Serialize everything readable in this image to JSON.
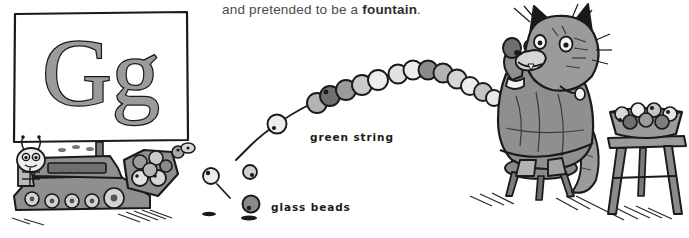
{
  "page": {
    "background_color": "#ffffff",
    "width": 689,
    "height": 238,
    "type": "illustrated-alphabet-book-page"
  },
  "caption": {
    "prefix": "and pretended to be a ",
    "emphasis": "fountain",
    "suffix": ".",
    "full_text": "and pretended to be a fountain.",
    "color": "#4a4a4a"
  },
  "letter_box": {
    "letters": "Gg",
    "uppercase": "G",
    "lowercase": "g",
    "fill_color": "#9b9b9b",
    "outline_color": "#1a1a1a",
    "border_color": "#1a1a1a"
  },
  "annotations": [
    {
      "id": "green-string",
      "label": "green string",
      "x": 310,
      "y": 131
    },
    {
      "id": "glass-beads",
      "label": "glass beads",
      "x": 271,
      "y": 201
    }
  ],
  "illustration": {
    "characters": [
      {
        "id": "bug-driver",
        "name": "bug driving bulldozer"
      },
      {
        "id": "cat",
        "name": "cat in dress holding bead string"
      }
    ],
    "objects": [
      {
        "id": "bulldozer",
        "name": "bulldozer with tracks and scoop"
      },
      {
        "id": "bead-arc",
        "name": "arc of strung glass beads"
      },
      {
        "id": "loose-beads",
        "name": "loose falling glass beads"
      },
      {
        "id": "bowl-of-beads",
        "name": "bowl of glass beads"
      },
      {
        "id": "short-stool",
        "name": "short stool"
      },
      {
        "id": "tall-stool",
        "name": "tall stool"
      }
    ],
    "palette": {
      "ink": "#1a1a1a",
      "gray_dark": "#6f6f6f",
      "gray_mid": "#9b9b9b",
      "gray_light": "#c9c9c9",
      "gray_pale": "#e2e2e2"
    }
  },
  "beads": {
    "strung": [
      {
        "x": 243,
        "y": 155,
        "r": 9,
        "tone": "gray_pale"
      },
      {
        "x": 272,
        "y": 150,
        "r": 9,
        "tone": "gray_pale"
      },
      {
        "x": 281,
        "y": 152,
        "r": 9,
        "tone": "gray_light"
      },
      {
        "x": 314,
        "y": 114,
        "r": 10,
        "tone": "gray_pale"
      },
      {
        "x": 317,
        "y": 105,
        "r": 10,
        "tone": "gray_mid"
      },
      {
        "x": 330,
        "y": 101,
        "r": 10,
        "tone": "gray_dark"
      },
      {
        "x": 345,
        "y": 92,
        "r": 10,
        "tone": "gray_mid"
      },
      {
        "x": 359,
        "y": 85,
        "r": 10,
        "tone": "gray_light"
      },
      {
        "x": 375,
        "y": 80,
        "r": 10,
        "tone": "gray_pale"
      },
      {
        "x": 395,
        "y": 74,
        "r": 9,
        "tone": "gray_pale"
      },
      {
        "x": 410,
        "y": 71,
        "r": 9,
        "tone": "gray_light"
      },
      {
        "x": 424,
        "y": 70,
        "r": 9,
        "tone": "gray_dark"
      },
      {
        "x": 438,
        "y": 72,
        "r": 9,
        "tone": "gray_mid"
      },
      {
        "x": 451,
        "y": 77,
        "r": 9,
        "tone": "gray_light"
      },
      {
        "x": 464,
        "y": 84,
        "r": 9,
        "tone": "gray_pale"
      },
      {
        "x": 477,
        "y": 90,
        "r": 9,
        "tone": "gray_light"
      },
      {
        "x": 490,
        "y": 94,
        "r": 8,
        "tone": "gray_pale"
      }
    ],
    "loose": [
      {
        "x": 211,
        "y": 176,
        "r": 8,
        "tone": "gray_pale"
      },
      {
        "x": 250,
        "y": 172,
        "r": 7,
        "tone": "gray_light"
      },
      {
        "x": 251,
        "y": 204,
        "r": 8,
        "tone": "gray_dark"
      },
      {
        "x": 178,
        "y": 152,
        "r": 6,
        "tone": "gray_mid"
      },
      {
        "x": 158,
        "y": 150,
        "r": 6,
        "tone": "gray_light"
      }
    ]
  }
}
